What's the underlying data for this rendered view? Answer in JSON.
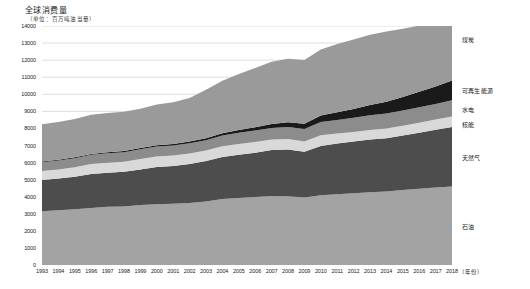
{
  "chart_data": {
    "type": "area",
    "stacked": true,
    "title": "全球消费量",
    "subtitle": "（单位：百万吨油当量）",
    "xlabel": "（年份）",
    "ylabel": "",
    "xlim": [
      1993,
      2018
    ],
    "ylim": [
      0,
      14000
    ],
    "grid": true,
    "legend_position": "right-outside",
    "x": [
      1993,
      1994,
      1995,
      1996,
      1997,
      1998,
      1999,
      2000,
      2001,
      2002,
      2003,
      2004,
      2005,
      2006,
      2007,
      2008,
      2009,
      2010,
      2011,
      2012,
      2013,
      2014,
      2015,
      2016,
      2017,
      2018
    ],
    "yticks": [
      0,
      1000,
      2000,
      3000,
      4000,
      5000,
      6000,
      7000,
      8000,
      9000,
      10000,
      11000,
      12000,
      13000,
      14000
    ],
    "xticks": [
      "1993",
      "1994",
      "1995",
      "1996",
      "1997",
      "1998",
      "1999",
      "2000",
      "2001",
      "2002",
      "2003",
      "2004",
      "2005",
      "2006",
      "2007",
      "2008",
      "2009",
      "2010",
      "2011",
      "2012",
      "2013",
      "2014",
      "2015",
      "2016",
      "2017",
      "2018"
    ],
    "series": [
      {
        "name": "石油",
        "color": "#a3a3a3",
        "order": 1,
        "values": [
          3150,
          3200,
          3260,
          3340,
          3410,
          3430,
          3510,
          3560,
          3590,
          3630,
          3720,
          3870,
          3930,
          3980,
          4040,
          4030,
          3960,
          4090,
          4150,
          4200,
          4260,
          4310,
          4400,
          4470,
          4540,
          4600
        ]
      },
      {
        "name": "天然气",
        "color": "#4d4d4d",
        "order": 2,
        "values": [
          1830,
          1860,
          1910,
          1990,
          2000,
          2030,
          2090,
          2180,
          2210,
          2280,
          2370,
          2450,
          2530,
          2590,
          2690,
          2740,
          2670,
          2880,
          2960,
          3030,
          3090,
          3110,
          3180,
          3270,
          3380,
          3490
        ]
      },
      {
        "name": "核能",
        "color": "#d9d9d9",
        "order": 3,
        "values": [
          527,
          540,
          560,
          580,
          585,
          595,
          610,
          615,
          620,
          625,
          620,
          630,
          630,
          635,
          620,
          615,
          610,
          626,
          600,
          560,
          563,
          574,
          580,
          592,
          596,
          611
        ]
      },
      {
        "name": "水电",
        "color": "#8c8c8c",
        "order": 4,
        "values": [
          510,
          520,
          530,
          545,
          550,
          555,
          565,
          580,
          575,
          595,
          600,
          630,
          650,
          670,
          680,
          700,
          720,
          775,
          790,
          830,
          860,
          880,
          885,
          910,
          920,
          950
        ]
      },
      {
        "name": "可再生能源",
        "color": "#1a1a1a",
        "order": 5,
        "values": [
          40,
          44,
          48,
          52,
          58,
          64,
          72,
          82,
          92,
          105,
          120,
          140,
          165,
          195,
          230,
          275,
          320,
          380,
          450,
          520,
          600,
          690,
          790,
          900,
          1020,
          1160
        ]
      },
      {
        "name": "煤炭",
        "color": "#9a9a9a",
        "order": 6,
        "values": [
          2190,
          2210,
          2250,
          2290,
          2300,
          2300,
          2300,
          2390,
          2440,
          2550,
          2830,
          3070,
          3280,
          3470,
          3640,
          3720,
          3730,
          3870,
          4000,
          4070,
          4110,
          4120,
          4010,
          3880,
          3890,
          3950
        ]
      }
    ]
  },
  "axis": {
    "xlabel_text": "（年份）"
  }
}
